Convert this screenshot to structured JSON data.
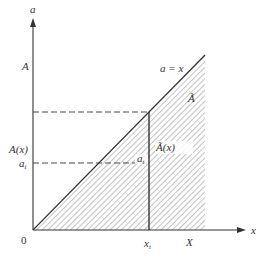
{
  "diagram": {
    "type": "set-region-plot",
    "axes": {
      "x_axis_label": "x",
      "y_axis_label": "a",
      "origin_label": "0"
    },
    "x_ticks": {
      "x_t": {
        "main": "x",
        "sub": "t"
      },
      "X": "X"
    },
    "y_ticks": {
      "A": "A",
      "A_x": "A(x)",
      "a_t": {
        "main": "a",
        "sub": "t"
      }
    },
    "annotations": {
      "diagonal": "a = x",
      "region": "Ã",
      "region_x": "Ã(x)",
      "point_label": {
        "main": "a",
        "sub": "t",
        "accent": "~"
      }
    },
    "colors": {
      "line": "#333333",
      "hatch": "#555555",
      "background": "#ffffff"
    }
  }
}
